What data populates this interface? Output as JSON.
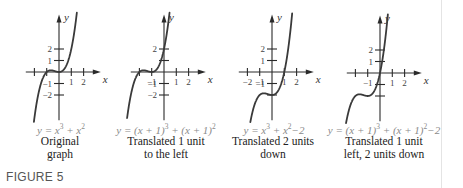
{
  "figure_label": "FIGURE 5",
  "panels": [
    {
      "origin": [
        59,
        72
      ],
      "x_ticks": [
        -2,
        -1,
        1,
        2
      ],
      "x_tick_labels": [
        {
          "v": -1,
          "t": ""
        },
        {
          "v": 1,
          "t": "1"
        },
        {
          "v": 2,
          "t": "2"
        }
      ],
      "y_ticks": [
        -2,
        -1,
        1,
        2
      ],
      "y_tick_labels": [
        {
          "v": 2,
          "t": "2"
        },
        {
          "v": 1,
          "t": "1"
        },
        {
          "v": -1,
          "t": "−1"
        },
        {
          "v": -2,
          "t": "−2"
        }
      ],
      "shift_x": 0,
      "shift_y": 0,
      "equation": {
        "lhs": "y = x",
        "p1": "3",
        "mid": " + x",
        "p2": "2",
        "tail": ""
      },
      "caption_line1": "Original",
      "caption_line2": "graph"
    },
    {
      "origin": [
        164,
        72
      ],
      "x_ticks": [
        -2,
        -1,
        1,
        2
      ],
      "x_tick_labels": [
        {
          "v": -1,
          "t": "−1"
        },
        {
          "v": 1,
          "t": "1"
        },
        {
          "v": 2,
          "t": "2"
        }
      ],
      "y_ticks": [
        -2,
        -1,
        1,
        2
      ],
      "y_tick_labels": [
        {
          "v": 2,
          "t": "2"
        },
        {
          "v": -1,
          "t": "−1"
        },
        {
          "v": -2,
          "t": "−2"
        }
      ],
      "shift_x": -1,
      "shift_y": 0,
      "equation": {
        "lhs": "y = (x + 1)",
        "p1": "3",
        "mid": " + (x + 1)",
        "p2": "2",
        "tail": ""
      },
      "caption_line1": "Translated 1 unit",
      "caption_line2": "to the left"
    },
    {
      "origin": [
        272,
        72
      ],
      "x_ticks": [
        -2,
        -1,
        1,
        2
      ],
      "x_tick_labels": [
        {
          "v": -2,
          "t": "−2"
        },
        {
          "v": -1,
          "t": "−1"
        },
        {
          "v": 1,
          "t": "1"
        },
        {
          "v": 2,
          "t": "2"
        }
      ],
      "y_ticks": [
        -2,
        -1,
        1,
        2
      ],
      "y_tick_labels": [
        {
          "v": 2,
          "t": "2"
        },
        {
          "v": 1,
          "t": "1"
        },
        {
          "v": -1,
          "t": "−1"
        }
      ],
      "shift_x": 0,
      "shift_y": -2,
      "equation": {
        "lhs": "y = x",
        "p1": "3",
        "mid": " + x",
        "p2": "2",
        "tail": "−2"
      },
      "caption_line1": "Translated 2 units",
      "caption_line2": "down"
    },
    {
      "origin": [
        380,
        73
      ],
      "x_ticks": [
        -2,
        -1,
        1,
        2
      ],
      "x_tick_labels": [
        {
          "v": -1,
          "t": "−1"
        },
        {
          "v": 1,
          "t": "1"
        },
        {
          "v": 2,
          "t": "2"
        }
      ],
      "y_ticks": [
        -2,
        -1,
        1,
        2
      ],
      "y_tick_labels": [
        {
          "v": 2,
          "t": "2"
        },
        {
          "v": 1,
          "t": "1"
        }
      ],
      "shift_x": -1,
      "shift_y": -2,
      "equation": {
        "lhs": "y = (x + 1)",
        "p1": "3",
        "mid": " + (x + 1)",
        "p2": "2",
        "tail": "−2"
      },
      "caption_line1": "Translated 1 unit",
      "caption_line2": "left, 2 units down"
    }
  ],
  "axis_labels": {
    "x": "x",
    "y": "y"
  },
  "scale": {
    "px_per_unit_x": 12.3,
    "px_per_unit_y": 11.5
  },
  "chart_data": [
    {
      "type": "line",
      "title": "y = x^3 + x^2",
      "caption": "Original graph",
      "function": "x^3 + x^2",
      "xlabel": "x",
      "ylabel": "y",
      "xlim": [
        -2,
        2
      ],
      "ylim": [
        -2,
        2.5
      ],
      "x_ticks": [
        -2,
        -1,
        1,
        2
      ],
      "y_ticks": [
        -2,
        -1,
        1,
        2
      ]
    },
    {
      "type": "line",
      "title": "y = (x+1)^3 + (x+1)^2",
      "caption": "Translated 1 unit to the left",
      "function": "(x+1)^3 + (x+1)^2",
      "xlabel": "x",
      "ylabel": "y",
      "xlim": [
        -2,
        2
      ],
      "ylim": [
        -2,
        2.5
      ],
      "x_ticks": [
        -2,
        -1,
        1,
        2
      ],
      "y_ticks": [
        -2,
        -1,
        1,
        2
      ]
    },
    {
      "type": "line",
      "title": "y = x^3 + x^2 - 2",
      "caption": "Translated 2 units down",
      "function": "x^3 + x^2 - 2",
      "xlabel": "x",
      "ylabel": "y",
      "xlim": [
        -2,
        2
      ],
      "ylim": [
        -4,
        2.5
      ],
      "x_ticks": [
        -2,
        -1,
        1,
        2
      ],
      "y_ticks": [
        -2,
        -1,
        1,
        2
      ]
    },
    {
      "type": "line",
      "title": "y = (x+1)^3 + (x+1)^2 - 2",
      "caption": "Translated 1 unit left, 2 units down",
      "function": "(x+1)^3 + (x+1)^2 - 2",
      "xlabel": "x",
      "ylabel": "y",
      "xlim": [
        -2,
        2
      ],
      "ylim": [
        -4,
        2.5
      ],
      "x_ticks": [
        -2,
        -1,
        1,
        2
      ],
      "y_ticks": [
        -2,
        -1,
        1,
        2
      ]
    }
  ]
}
